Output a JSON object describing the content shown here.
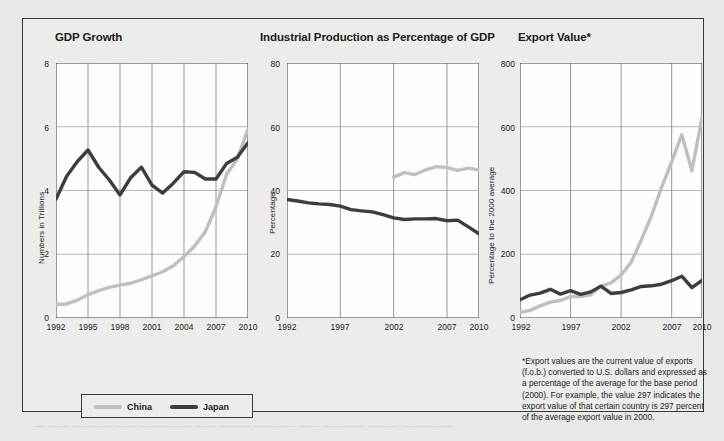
{
  "figure": {
    "background_color": "#ececeb",
    "border_color": "#3a3a38",
    "ghost_text": "— —— ———— —— ————— —— ——— ———— —— ———— ——— —————"
  },
  "legend": {
    "items": [
      {
        "label": "China",
        "color": "#bfbfbf"
      },
      {
        "label": "Japan",
        "color": "#3d3d3d"
      }
    ]
  },
  "footnote": {
    "text": "*Export values are the current value of exports (f.o.b.) converted to U.S. dollars and expressed as a percentage of the average for the base period (2000). For example, the value 297 indicates the export value of that certain country is 297 percent of the average export value in 2000."
  },
  "chart_data": [
    {
      "type": "line",
      "title": "GDP Growth",
      "xlabel": "",
      "ylabel": "Numbers in Trillions",
      "xlim": [
        1992,
        2010
      ],
      "ylim": [
        0,
        8
      ],
      "yticks": [
        0,
        2,
        4,
        6,
        8
      ],
      "xticks": [
        1992,
        1995,
        1998,
        2001,
        2004,
        2007,
        2010
      ],
      "grid": true,
      "legend_position": "bottom-left (shared)",
      "x": [
        1992,
        1993,
        1994,
        1995,
        1996,
        1997,
        1998,
        1999,
        2000,
        2001,
        2002,
        2003,
        2004,
        2005,
        2006,
        2007,
        2008,
        2009,
        2010
      ],
      "series": [
        {
          "name": "China",
          "color": "#bfbfbf",
          "values": [
            0.43,
            0.44,
            0.56,
            0.73,
            0.86,
            0.96,
            1.03,
            1.09,
            1.2,
            1.32,
            1.45,
            1.64,
            1.93,
            2.26,
            2.71,
            3.49,
            4.52,
            4.99,
            5.93
          ]
        },
        {
          "name": "Japan",
          "color": "#3d3d3d",
          "values": [
            3.73,
            4.45,
            4.91,
            5.27,
            4.73,
            4.33,
            3.86,
            4.4,
            4.73,
            4.17,
            3.92,
            4.23,
            4.59,
            4.57,
            4.36,
            4.36,
            4.85,
            5.04,
            5.5
          ]
        }
      ]
    },
    {
      "type": "line",
      "title": "Industrial Production as Percentage of GDP",
      "xlabel": "",
      "ylabel": "Percentage",
      "xlim": [
        1992,
        2010
      ],
      "ylim": [
        0,
        80
      ],
      "yticks": [
        0,
        20,
        40,
        60,
        80
      ],
      "xticks": [
        1992,
        1997,
        2002,
        2007,
        2010
      ],
      "grid": true,
      "x": [
        1992,
        1993,
        1994,
        1995,
        1996,
        1997,
        1998,
        1999,
        2000,
        2001,
        2002,
        2003,
        2004,
        2005,
        2006,
        2007,
        2008,
        2009,
        2010
      ],
      "series": [
        {
          "name": "China",
          "color": "#bfbfbf",
          "values": [
            null,
            null,
            null,
            null,
            null,
            null,
            null,
            null,
            null,
            null,
            44.2,
            45.6,
            45.0,
            46.5,
            47.5,
            47.2,
            46.3,
            47.0,
            46.4
          ]
        },
        {
          "name": "Japan",
          "color": "#3d3d3d",
          "values": [
            37.2,
            36.7,
            36.1,
            35.8,
            35.6,
            35.1,
            34.0,
            33.6,
            33.3,
            32.4,
            31.4,
            30.9,
            31.1,
            31.1,
            31.2,
            30.5,
            30.7,
            28.6,
            26.4
          ]
        }
      ]
    },
    {
      "type": "line",
      "title": "Export Value*",
      "xlabel": "",
      "ylabel": "Percentage to the 2000 average",
      "xlim": [
        1992,
        2010
      ],
      "ylim": [
        0,
        800
      ],
      "yticks": [
        0,
        200,
        400,
        600,
        800
      ],
      "xticks": [
        1992,
        1997,
        2002,
        2007,
        2010
      ],
      "grid": true,
      "x": [
        1992,
        1993,
        1994,
        1995,
        1996,
        1997,
        1998,
        1999,
        2000,
        2001,
        2002,
        2003,
        2004,
        2005,
        2006,
        2007,
        2008,
        2009,
        2010
      ],
      "series": [
        {
          "name": "China",
          "color": "#bfbfbf",
          "values": [
            17,
            24,
            38,
            50,
            55,
            67,
            67,
            73,
            100,
            110,
            135,
            175,
            245,
            320,
            410,
            490,
            575,
            462,
            630
          ]
        },
        {
          "name": "Japan",
          "color": "#3d3d3d",
          "values": [
            57,
            72,
            78,
            90,
            75,
            86,
            74,
            82,
            100,
            77,
            80,
            88,
            99,
            101,
            106,
            117,
            131,
            95,
            118
          ]
        }
      ]
    }
  ]
}
